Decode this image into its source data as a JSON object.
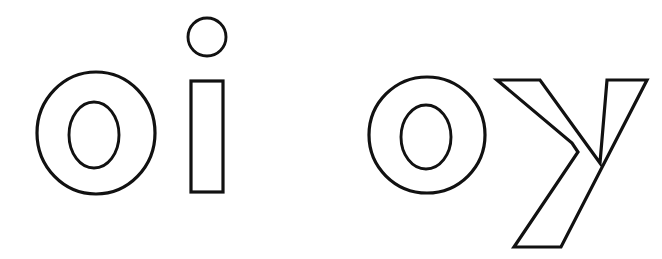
{
  "page": {
    "title": "oi oy",
    "background_color": "#ffffff",
    "stroke_color": "#111111",
    "fill_color": "#ffffff",
    "width": 662,
    "height": 259,
    "style": "outline letters, hollow line-art, worksheet style"
  },
  "words": [
    {
      "id": "word-oi",
      "text": "oi",
      "letters": [
        {
          "id": "letter-o-1",
          "character": "o",
          "shape": "ring",
          "outer": {
            "cx": 96,
            "cy": 133,
            "rx": 59,
            "ry": 61
          },
          "inner": {
            "cx": 94,
            "cy": 135,
            "rx": 25,
            "ry": 33
          }
        },
        {
          "id": "letter-i",
          "character": "i",
          "shape": "stem-with-dot",
          "dot": {
            "cx": 207,
            "cy": 37,
            "rx": 19,
            "ry": 19
          },
          "stem": {
            "x": 191,
            "y": 81,
            "width": 32,
            "height": 111
          }
        }
      ]
    },
    {
      "id": "word-oy",
      "text": "oy",
      "letters": [
        {
          "id": "letter-o-2",
          "character": "o",
          "shape": "ring",
          "outer": {
            "cx": 427,
            "cy": 135,
            "rx": 58,
            "ry": 58
          },
          "inner": {
            "cx": 426,
            "cy": 137,
            "rx": 25,
            "ry": 32
          }
        },
        {
          "id": "letter-y",
          "character": "y",
          "shape": "descender-fork",
          "points": "497,80 540,80 600,163 607,80 647,80 561,247 514,247 578,152 572,143"
        }
      ]
    }
  ],
  "annotations": {
    "baseline_y": 192,
    "x_height_top_y": 74,
    "descender_bottom_y": 247
  }
}
